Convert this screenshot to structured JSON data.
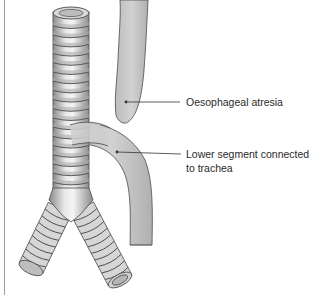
{
  "figure": {
    "labels": [
      {
        "id": "upper-pouch",
        "lines": [
          "Oesophageal atresia"
        ]
      },
      {
        "id": "lower-segment",
        "lines": [
          "Lower segment connected",
          "to trachea"
        ]
      }
    ],
    "colors": {
      "tube_fill": "#c4c4c4",
      "tube_light": "#eeeeee",
      "ring_dark": "#5a5a5a",
      "outline": "#4a4a4a",
      "leader_line": "#333333"
    }
  }
}
